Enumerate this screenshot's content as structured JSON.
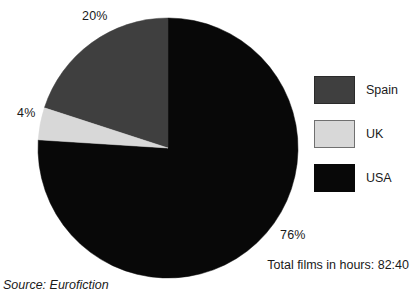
{
  "chart_data": {
    "type": "pie",
    "title": "",
    "labels": [
      "Spain",
      "UK",
      "USA"
    ],
    "values": [
      20,
      4,
      76
    ],
    "value_labels": [
      "20%",
      "4%",
      "76%"
    ],
    "unit": "percent",
    "colors": [
      "#3f3f3f",
      "#d8d8d8",
      "#080808"
    ],
    "start_angle_deg": 90,
    "direction": "counterclockwise",
    "legend_position": "right",
    "grid": false,
    "annotations": {
      "total": "Total films in hours: 82:40",
      "source": "Source: Eurofiction"
    }
  },
  "pie": {
    "center_x": 168,
    "center_y": 148,
    "radius": 130,
    "slices": [
      {
        "name": "Spain",
        "percent_label": "20%",
        "color": "#3f3f3f"
      },
      {
        "name": "UK",
        "percent_label": "4%",
        "color": "#d8d8d8"
      },
      {
        "name": "USA",
        "percent_label": "76%",
        "color": "#080808"
      }
    ]
  },
  "callouts": {
    "spain": "20%",
    "uk": "4%",
    "usa": "76%"
  },
  "legend": {
    "items": [
      {
        "label": "Spain",
        "color": "#3f3f3f",
        "border": "#2a2a2a"
      },
      {
        "label": "UK",
        "color": "#d8d8d8",
        "border": "#707070"
      },
      {
        "label": "USA",
        "color": "#080808",
        "border": "#080808"
      }
    ]
  },
  "footer": {
    "total": "Total films in hours: 82:40",
    "source": "Source: Eurofiction"
  }
}
